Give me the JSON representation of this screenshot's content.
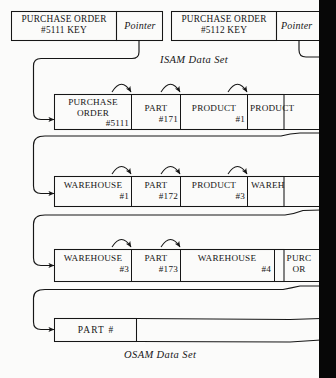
{
  "figure": {
    "type": "database-record-linkage-diagram",
    "captions": [
      {
        "id": "isam",
        "text": "ISAM Data Set"
      },
      {
        "id": "osam",
        "text": "OSAM Data Set"
      }
    ]
  },
  "isam_row": {
    "records": [
      {
        "key_line1": "PURCHASE ORDER",
        "key_line2": "#5111 KEY",
        "pointer_label": "Pointer"
      },
      {
        "key_line1": "PURCHASE ORDER",
        "key_line2": "#5112 KEY",
        "pointer_label": "Pointer"
      }
    ]
  },
  "osam_rows": [
    {
      "id": "row-1",
      "fields": [
        {
          "name_line1": "PURCHASE",
          "name_line2": "ORDER",
          "number": "#5111"
        },
        {
          "name_line1": "PART",
          "name_line2": "",
          "number": "#171"
        },
        {
          "name_line1": "PRODUCT",
          "name_line2": "",
          "number": "#1"
        },
        {
          "name_line1": "PRODUCT",
          "name_line2": "",
          "number": ""
        }
      ]
    },
    {
      "id": "row-2",
      "fields": [
        {
          "name_line1": "WAREHOUSE",
          "name_line2": "",
          "number": "#1"
        },
        {
          "name_line1": "PART",
          "name_line2": "",
          "number": "#172"
        },
        {
          "name_line1": "PRODUCT",
          "name_line2": "",
          "number": "#3"
        },
        {
          "name_line1": "WAREH",
          "name_line2": "",
          "number": ""
        }
      ]
    },
    {
      "id": "row-3",
      "fields": [
        {
          "name_line1": "WAREHOUSE",
          "name_line2": "",
          "number": "#3"
        },
        {
          "name_line1": "PART",
          "name_line2": "",
          "number": "#173"
        },
        {
          "name_line1": "WAREHOUSE",
          "name_line2": "",
          "number": "#4"
        },
        {
          "name_line1": "PURC",
          "name_line2": "OR",
          "number": ""
        }
      ]
    },
    {
      "id": "row-4",
      "fields": [
        {
          "name_line1": "PART  #",
          "name_line2": "",
          "number": ""
        }
      ]
    }
  ],
  "colors": {
    "ink": "#161616",
    "paper": "#fbfbfa",
    "gutter": "#070707"
  }
}
